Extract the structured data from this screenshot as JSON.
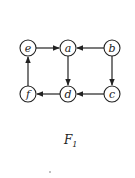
{
  "figure": {
    "caption": "F",
    "caption_subscript": "1"
  },
  "nodes": [
    {
      "id": "e",
      "label": "e",
      "x": 28,
      "y": 48
    },
    {
      "id": "a",
      "label": "a",
      "x": 68,
      "y": 48
    },
    {
      "id": "b",
      "label": "b",
      "x": 112,
      "y": 48
    },
    {
      "id": "f",
      "label": "f",
      "x": 28,
      "y": 94
    },
    {
      "id": "d",
      "label": "d",
      "x": 68,
      "y": 94
    },
    {
      "id": "c",
      "label": "c",
      "x": 112,
      "y": 94
    }
  ],
  "edges": [
    {
      "from": "e",
      "to": "a"
    },
    {
      "from": "b",
      "to": "a"
    },
    {
      "from": "a",
      "to": "d"
    },
    {
      "from": "b",
      "to": "c"
    },
    {
      "from": "c",
      "to": "d"
    },
    {
      "from": "d",
      "to": "f"
    },
    {
      "from": "f",
      "to": "e"
    }
  ],
  "colors": {
    "stroke": "#222222",
    "background": "#ffffff"
  }
}
